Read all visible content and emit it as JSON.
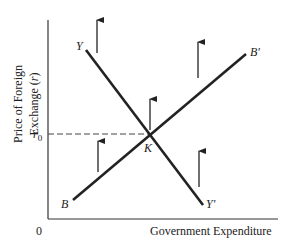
{
  "diagram": {
    "y_axis_label_line1": "Price of Foreign",
    "y_axis_label_line2": "Exchange (r)",
    "x_axis_label": "Government Expenditure",
    "origin_label": "0",
    "r0_label": "r",
    "r0_subscript": "0",
    "curves": [
      {
        "name": "YY'",
        "start_label": "Y",
        "end_label": "Y′",
        "slope": "negative"
      },
      {
        "name": "BB'",
        "start_label": "B",
        "end_label": "B′",
        "slope": "positive"
      }
    ],
    "intersection_label": "K",
    "arrows": {
      "count": 5,
      "direction": "up"
    },
    "line_color": "#222222"
  }
}
